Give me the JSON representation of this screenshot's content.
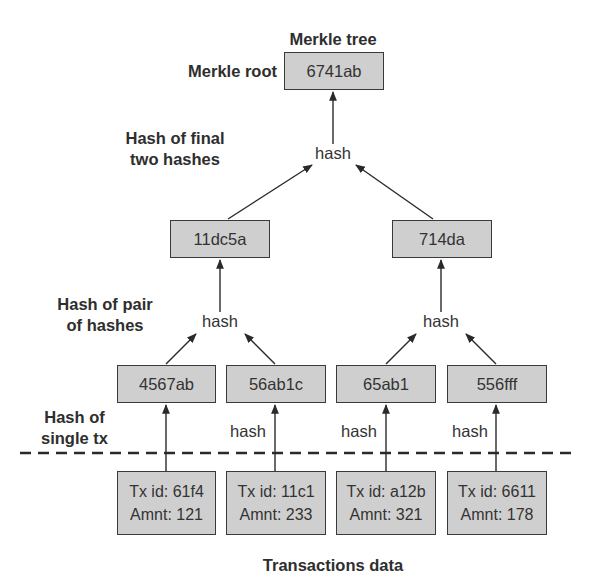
{
  "title": "Merkle tree",
  "root": {
    "label": "Merkle root",
    "value": "6741ab"
  },
  "annotations": {
    "final": [
      "Hash of final",
      "two hashes"
    ],
    "pair": [
      "Hash of pair",
      "of hashes"
    ],
    "single": [
      "Hash of single tx"
    ],
    "single_lines": [
      "Hash of",
      "single tx"
    ]
  },
  "hash_label": "hash",
  "level2": [
    {
      "value": "11dc5a"
    },
    {
      "value": "714da"
    }
  ],
  "leaves": [
    {
      "value": "4567ab",
      "show_hash_label": false
    },
    {
      "value": "56ab1c",
      "show_hash_label": true
    },
    {
      "value": "65ab1",
      "show_hash_label": true
    },
    {
      "value": "556fff",
      "show_hash_label": true
    }
  ],
  "transactions": [
    {
      "id_line": "Tx id: 61f4",
      "amount_line": "Amnt: 121"
    },
    {
      "id_line": "Tx id: 11c1",
      "amount_line": "Amnt: 233"
    },
    {
      "id_line": "Tx id: a12b",
      "amount_line": "Amnt: 321"
    },
    {
      "id_line": "Tx id: 6611",
      "amount_line": "Amnt: 178"
    }
  ],
  "footer": "Transactions data",
  "colors": {
    "box_fill": "#cfcfcf",
    "stroke": "#3a3a3a",
    "text": "#2e2e2e"
  }
}
